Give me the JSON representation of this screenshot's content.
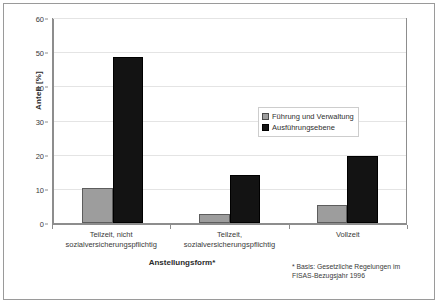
{
  "chart_data": {
    "type": "bar",
    "title": "",
    "subtitle": "",
    "categories": [
      "Teilzeit, nicht\nsozialversicherungspflichtig",
      "Teilzeit,\nsozialversicherungspflichtig",
      "Vollzeit"
    ],
    "category_lines": [
      [
        "Teilzeit, nicht",
        "sozialversicherungspflichtig"
      ],
      [
        "Teilzeit,",
        "sozialversicherungspflichtig"
      ],
      [
        "Vollzeit"
      ]
    ],
    "series": [
      {
        "name": "Führung und Verwaltung",
        "color": "#9d9d9d",
        "values": [
          10.3,
          2.5,
          5.2
        ]
      },
      {
        "name": "Ausführungsebene",
        "color": "#131313",
        "values": [
          48.7,
          14.0,
          19.6
        ]
      }
    ],
    "xlabel": "Anstellungsform*",
    "ylabel": "Anteil [%]",
    "ylim": [
      0,
      60
    ],
    "yticks": [
      0,
      10,
      20,
      30,
      40,
      50,
      60
    ],
    "ytick_labels": [
      "0",
      "10",
      "20",
      "30",
      "40",
      "50",
      "60"
    ],
    "grid": true,
    "grid_axis": "y",
    "legend_position": "upper-right-inside",
    "annotations": [
      "* Basis: Gesetzliche Regelungen im",
      "FISAS-Bezugsjahr 1996"
    ]
  },
  "footnote": {
    "line1": "* Basis: Gesetzliche Regelungen im",
    "line2": "FISAS-Bezugsjahr 1996"
  }
}
